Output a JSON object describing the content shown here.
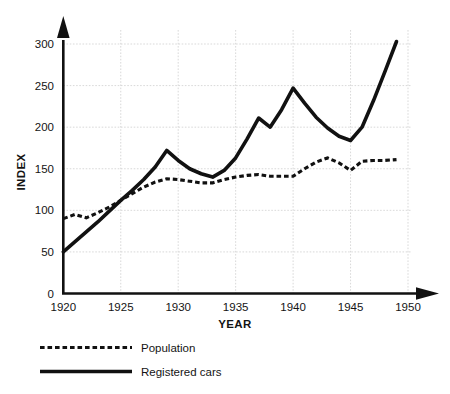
{
  "chart_data": {
    "type": "line",
    "title": "",
    "xlabel": "YEAR",
    "ylabel": "INDEX",
    "xlim": [
      1920,
      1950
    ],
    "ylim": [
      0,
      300
    ],
    "grid": true,
    "legend_position": "below-left",
    "xticks": [
      "1920",
      "1925",
      "1930",
      "1935",
      "1940",
      "1945",
      "1950"
    ],
    "yticks": [
      "0",
      "50",
      "100",
      "150",
      "200",
      "250",
      "300"
    ],
    "x": [
      1920,
      1921,
      1922,
      1923,
      1924,
      1925,
      1926,
      1927,
      1928,
      1929,
      1930,
      1931,
      1932,
      1933,
      1934,
      1935,
      1936,
      1937,
      1938,
      1939,
      1940,
      1941,
      1942,
      1943,
      1944,
      1945,
      1946,
      1947,
      1948,
      1949
    ],
    "series": [
      {
        "name": "Population",
        "style": "dashed",
        "color": "#111111",
        "values": [
          90,
          95,
          91,
          97,
          104,
          112,
          120,
          128,
          134,
          138,
          137,
          135,
          133,
          133,
          137,
          140,
          142,
          143,
          141,
          141,
          141,
          150,
          158,
          163,
          157,
          148,
          159,
          160,
          160,
          161
        ]
      },
      {
        "name": "Registered cars",
        "style": "solid",
        "color": "#111111",
        "values": [
          50,
          62,
          74,
          86,
          99,
          112,
          124,
          137,
          152,
          172,
          160,
          150,
          144,
          140,
          148,
          163,
          186,
          211,
          200,
          221,
          247,
          229,
          212,
          199,
          189,
          184,
          200,
          232,
          267,
          303
        ]
      }
    ]
  },
  "legend": {
    "items": [
      {
        "label": "Population",
        "style": "dashed"
      },
      {
        "label": "Registered cars",
        "style": "solid"
      }
    ]
  },
  "axes": {
    "y_title": "INDEX",
    "x_title": "YEAR"
  }
}
